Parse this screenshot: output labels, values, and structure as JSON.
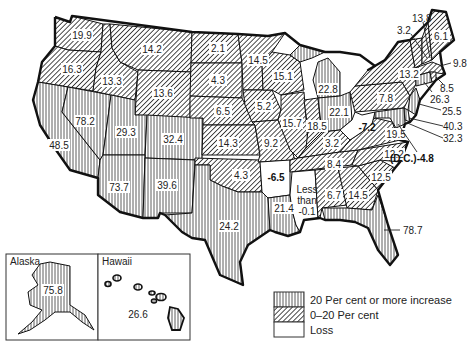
{
  "map": {
    "subject": "Per cent change in population by state",
    "legend": [
      {
        "key": "increase20",
        "label": "20 Per cent or more increase",
        "pattern": "vertical-lines"
      },
      {
        "key": "increase0to20",
        "label": "0–20 Per cent",
        "pattern": "diagonal-lines"
      },
      {
        "key": "loss",
        "label": "Loss",
        "pattern": "blank"
      }
    ],
    "insets": {
      "alaska": {
        "title": "Alaska",
        "value": "75.8",
        "category": "increase20"
      },
      "hawaii": {
        "title": "Hawaii",
        "value": "26.6",
        "category": "increase20"
      }
    },
    "states": [
      {
        "name": "Washington",
        "value": "19.9",
        "category": "increase0to20"
      },
      {
        "name": "Oregon",
        "value": "16.3",
        "category": "increase0to20"
      },
      {
        "name": "California",
        "value": "48.5",
        "category": "increase20"
      },
      {
        "name": "Nevada",
        "value": "78.2",
        "category": "increase20"
      },
      {
        "name": "Idaho",
        "value": "13.3",
        "category": "increase0to20"
      },
      {
        "name": "Montana",
        "value": "14.2",
        "category": "increase0to20"
      },
      {
        "name": "Wyoming",
        "value": "13.6",
        "category": "increase0to20"
      },
      {
        "name": "Utah",
        "value": "29.3",
        "category": "increase20"
      },
      {
        "name": "Colorado",
        "value": "32.4",
        "category": "increase20"
      },
      {
        "name": "Arizona",
        "value": "73.7",
        "category": "increase20"
      },
      {
        "name": "New Mexico",
        "value": "39.6",
        "category": "increase20"
      },
      {
        "name": "North Dakota",
        "value": "2.1",
        "category": "increase0to20"
      },
      {
        "name": "South Dakota",
        "value": "4.3",
        "category": "increase0to20"
      },
      {
        "name": "Nebraska",
        "value": "6.5",
        "category": "increase0to20"
      },
      {
        "name": "Kansas",
        "value": "14.3",
        "category": "increase0to20"
      },
      {
        "name": "Oklahoma",
        "value": "4.3",
        "category": "increase0to20"
      },
      {
        "name": "Texas",
        "value": "24.2",
        "category": "increase20"
      },
      {
        "name": "Minnesota",
        "value": "14.5",
        "category": "increase0to20"
      },
      {
        "name": "Iowa",
        "value": "5.2",
        "category": "increase0to20"
      },
      {
        "name": "Missouri",
        "value": "9.2",
        "category": "increase0to20"
      },
      {
        "name": "Arkansas",
        "value": "-6.5",
        "category": "loss"
      },
      {
        "name": "Louisiana",
        "value": "21.4",
        "category": "increase20"
      },
      {
        "name": "Wisconsin",
        "value": "15.1",
        "category": "increase0to20"
      },
      {
        "name": "Illinois",
        "value": "15.7",
        "category": "increase0to20"
      },
      {
        "name": "Michigan",
        "value": "22.8",
        "category": "increase20"
      },
      {
        "name": "Indiana",
        "value": "18.5",
        "category": "increase0to20"
      },
      {
        "name": "Ohio",
        "value": "22.1",
        "category": "increase20"
      },
      {
        "name": "Kentucky",
        "value": "3.2",
        "category": "increase0to20"
      },
      {
        "name": "Tennessee",
        "value": "8.4",
        "category": "increase0to20"
      },
      {
        "name": "Mississippi",
        "value": "Less than -0.1",
        "category": "loss"
      },
      {
        "name": "Alabama",
        "value": "6.7",
        "category": "increase0to20"
      },
      {
        "name": "Georgia",
        "value": "14.5",
        "category": "increase0to20"
      },
      {
        "name": "Florida",
        "value": "78.7",
        "category": "increase20"
      },
      {
        "name": "South Carolina",
        "value": "12.5",
        "category": "increase0to20"
      },
      {
        "name": "North Carolina",
        "value": "12.2",
        "category": "increase0to20"
      },
      {
        "name": "Virginia",
        "value": "19.5",
        "category": "increase0to20"
      },
      {
        "name": "West Virginia",
        "value": "-7.2",
        "category": "loss"
      },
      {
        "name": "Pennsylvania",
        "value": "7.8",
        "category": "increase0to20"
      },
      {
        "name": "New York",
        "value": "13.2",
        "category": "increase0to20"
      },
      {
        "name": "Vermont",
        "value": "3.2",
        "category": "increase0to20"
      },
      {
        "name": "New Hampshire",
        "value": "13.8",
        "category": "increase0to20"
      },
      {
        "name": "Maine",
        "value": "6.1",
        "category": "increase0to20"
      },
      {
        "name": "Massachusetts",
        "value": "9.8",
        "category": "increase0to20"
      },
      {
        "name": "Rhode Island",
        "value": "8.5",
        "category": "increase0to20"
      },
      {
        "name": "Connecticut",
        "value": "26.3",
        "category": "increase20"
      },
      {
        "name": "New Jersey",
        "value": "25.5",
        "category": "increase20"
      },
      {
        "name": "Delaware",
        "value": "40.3",
        "category": "increase20"
      },
      {
        "name": "Maryland",
        "value": "32.3",
        "category": "increase20"
      },
      {
        "name": "District of Columbia",
        "value": "(D.C.)-4.8",
        "category": "loss"
      }
    ],
    "labels": {
      "wa": "19.9",
      "or": "16.3",
      "ca": "48.5",
      "nv": "78.2",
      "id": "13.3",
      "mt": "14.2",
      "wy": "13.6",
      "ut": "29.3",
      "co": "32.4",
      "az": "73.7",
      "nm": "39.6",
      "nd": "2.1",
      "sd": "4.3",
      "ne": "6.5",
      "ks": "14.3",
      "ok": "4.3",
      "tx": "24.2",
      "mn": "14.5",
      "ia": "5.2",
      "mo": "9.2",
      "ar": "-6.5",
      "la": "21.4",
      "wi": "15.1",
      "il": "15.7",
      "mi": "22.8",
      "in": "18.5",
      "oh": "22.1",
      "ky": "3.2",
      "tn": "8.4",
      "ms1": "Less",
      "ms2": "than",
      "ms3": "-0.1",
      "al": "6.7",
      "ga": "14.5",
      "fl": "78.7",
      "sc": "12.5",
      "nc": "12.2",
      "va": "19.5",
      "wv": "-7.2",
      "pa": "7.8",
      "ny": "13.2",
      "vt": "3.2",
      "nh": "13.8",
      "me": "6.1",
      "ma": "9.8",
      "ri": "8.5",
      "ct": "26.3",
      "nj": "25.5",
      "de": "40.3",
      "md": "32.3",
      "dc": "(D.C.)-4.8",
      "ak": "75.8",
      "hi": "26.6"
    }
  }
}
